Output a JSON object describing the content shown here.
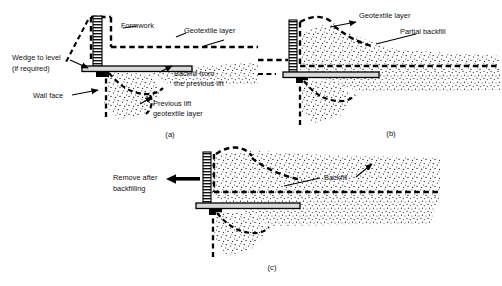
{
  "figure": {
    "type": "engineering-diagram",
    "background_color": "#ffffff",
    "line_color": "#000000",
    "panel_count": 3
  },
  "panels": [
    {
      "id": "a",
      "id_label": "(a)",
      "caption_position": "bottom-center",
      "labels": [
        {
          "key": "formwork",
          "text": "Formwork",
          "line1": "Formwork",
          "line2": ""
        },
        {
          "key": "geotextile_layer",
          "text": "Geotextile layer",
          "line1": "Geotextile layer",
          "line2": ""
        },
        {
          "key": "wedge_to_level",
          "text": "Wedge to level (if required)",
          "line1": "Wedge to level",
          "line2": "(if required)"
        },
        {
          "key": "wall_face",
          "text": "Wall face",
          "line1": "Wall face",
          "line2": ""
        },
        {
          "key": "backfill_previous",
          "text": "Backfill from the previous lift",
          "line1": "Backfill from",
          "line2": "the previous lift"
        },
        {
          "key": "previous_lift_geotextile",
          "text": "Previous lift geotextile layer",
          "line1": "Previous lift",
          "line2": "geotextile layer"
        }
      ]
    },
    {
      "id": "b",
      "id_label": "(b)",
      "caption_position": "bottom-center",
      "labels": [
        {
          "key": "geotextile_layer",
          "text": "Geotextile layer",
          "line1": "Geotextile layer",
          "line2": ""
        },
        {
          "key": "partial_backfill",
          "text": "Partial backfill",
          "line1": "Partial backfill",
          "line2": ""
        }
      ]
    },
    {
      "id": "c",
      "id_label": "(c)",
      "caption_position": "bottom-center",
      "labels": [
        {
          "key": "remove_after_backfilling",
          "text": "Remove after backfilling",
          "line1": "Remove after",
          "line2": "backfilling"
        },
        {
          "key": "backfill",
          "text": "Backfill",
          "line1": "Backfill",
          "line2": ""
        }
      ]
    }
  ],
  "elements": {
    "formwork_column": "hatched vertical L-shaped form panel",
    "geotextile": "heavy dashed line",
    "soil_fill": "stippled dot texture",
    "wedge": "small solid black block",
    "arrow_remove": "solid left-pointing arrow"
  }
}
